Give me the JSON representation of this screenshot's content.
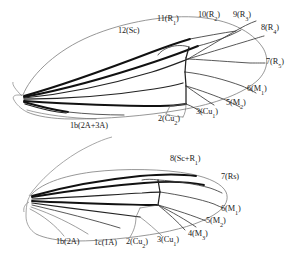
{
  "figure": {
    "background_color": "#ffffff",
    "ink_color": "#111111",
    "outline_color": "#7c7c7c"
  },
  "forewing": {
    "name": "forewing",
    "labels": [
      {
        "id": "fw-12-sc",
        "number": "12",
        "vein": "Sc",
        "text": "12(Sc)",
        "x": 118,
        "y": 27
      },
      {
        "id": "fw-11-r1",
        "number": "11",
        "vein": "R",
        "sub": "1",
        "text": "11(R1)",
        "x": 157,
        "y": 15
      },
      {
        "id": "fw-10-r2",
        "number": "10",
        "vein": "R",
        "sub": "2",
        "text": "10(R2)",
        "x": 198,
        "y": 11
      },
      {
        "id": "fw-9-r3",
        "number": "9",
        "vein": "R",
        "sub": "3",
        "text": "9(R3)",
        "x": 233,
        "y": 11
      },
      {
        "id": "fw-8-r4",
        "number": "8",
        "vein": "R",
        "sub": "4",
        "text": "8(R4)",
        "x": 263,
        "y": 24
      },
      {
        "id": "fw-7-r5",
        "number": "7",
        "vein": "R",
        "sub": "5",
        "text": "7(R5)",
        "x": 267,
        "y": 61
      },
      {
        "id": "fw-6-m1",
        "number": "6",
        "vein": "M",
        "sub": "1",
        "text": "6(M1)",
        "x": 248,
        "y": 87
      },
      {
        "id": "fw-5-m2",
        "number": "5",
        "vein": "M",
        "sub": "2",
        "text": "5(M2)",
        "x": 227,
        "y": 101
      },
      {
        "id": "fw-3-cu1",
        "number": "3",
        "vein": "Cu",
        "sub": "1",
        "text": "3(Cu1)",
        "x": 196,
        "y": 110
      },
      {
        "id": "fw-2-cu2",
        "number": "2",
        "vein": "Cu",
        "sub": "2",
        "text": "2(Cu2)",
        "x": 159,
        "y": 117
      },
      {
        "id": "fw-1b-2a3a",
        "number": "1b",
        "vein": "2A+3A",
        "text": "1b(2A+3A)",
        "x": 74,
        "y": 124
      }
    ]
  },
  "hindwing": {
    "name": "hindwing",
    "labels": [
      {
        "id": "hw-8-scr1",
        "number": "8",
        "vein": "Sc+R",
        "sub": "1",
        "text": "8(Sc+R1)",
        "x": 172,
        "y": 157
      },
      {
        "id": "hw-7-rs",
        "number": "7",
        "vein": "Rs",
        "text": "7(Rs)",
        "x": 221,
        "y": 175
      },
      {
        "id": "hw-6-m1",
        "number": "6",
        "vein": "M",
        "sub": "1",
        "text": "6(M1)",
        "x": 221,
        "y": 208
      },
      {
        "id": "hw-5-m2",
        "number": "5",
        "vein": "M",
        "sub": "2",
        "text": "5(M2)",
        "x": 207,
        "y": 220
      },
      {
        "id": "hw-4-m3",
        "number": "4",
        "vein": "M",
        "sub": "3",
        "text": "4(M3)",
        "x": 189,
        "y": 233
      },
      {
        "id": "hw-3-cu1",
        "number": "3",
        "vein": "Cu",
        "sub": "1",
        "text": "3(Cu1)",
        "x": 158,
        "y": 238
      },
      {
        "id": "hw-2-cu2",
        "number": "2",
        "vein": "Cu",
        "sub": "2",
        "text": "2(Cu2)",
        "x": 127,
        "y": 240
      },
      {
        "id": "hw-1c-1a",
        "number": "1c",
        "vein": "1A",
        "text": "1c(1A)",
        "x": 96,
        "y": 241
      },
      {
        "id": "hw-1b-2a",
        "number": "1b",
        "vein": "2A",
        "text": "1b(2A)",
        "x": 58,
        "y": 240
      }
    ]
  }
}
